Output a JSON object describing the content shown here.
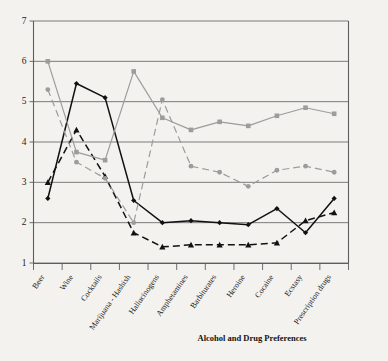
{
  "chart_data": {
    "type": "line",
    "title": "",
    "xlabel": "Alcohol and Drug Preferences",
    "ylabel": "",
    "ylim": [
      1,
      7
    ],
    "yticks": [
      1,
      2,
      3,
      4,
      5,
      6,
      7
    ],
    "grid": true,
    "legend": "none",
    "categories": [
      "Beer",
      "Wine",
      "Cocktails",
      "Marijuana - Hashish",
      "Hallucinogens",
      "Amphetamines",
      "Barbiturates",
      "Heroine",
      "Cocaine",
      "Ecstasy",
      "Prescription drugs"
    ],
    "series": [
      {
        "name": "series-black-solid",
        "color": "#111111",
        "line_style": "solid",
        "marker": "diamond",
        "values": [
          2.6,
          5.45,
          5.1,
          2.55,
          2.0,
          2.05,
          2.0,
          1.95,
          2.35,
          1.75,
          2.6
        ]
      },
      {
        "name": "series-black-dashed",
        "color": "#111111",
        "line_style": "dashed",
        "marker": "triangle",
        "values": [
          3.0,
          4.3,
          3.15,
          1.75,
          1.4,
          1.45,
          1.45,
          1.45,
          1.5,
          2.05,
          2.25
        ]
      },
      {
        "name": "series-gray-solid",
        "color": "#9c9c9c",
        "line_style": "solid",
        "marker": "square",
        "values": [
          6.0,
          3.75,
          3.55,
          5.75,
          4.6,
          4.3,
          4.5,
          4.4,
          4.65,
          4.85,
          4.7
        ]
      },
      {
        "name": "series-gray-dashed",
        "color": "#9c9c9c",
        "line_style": "dashed",
        "marker": "circle",
        "values": [
          5.3,
          3.5,
          3.1,
          2.0,
          5.05,
          3.4,
          3.25,
          2.9,
          3.3,
          3.4,
          3.25
        ]
      }
    ]
  },
  "axis": {
    "y_tick_labels": [
      "1",
      "2",
      "3",
      "4",
      "5",
      "6",
      "7"
    ],
    "x_axis_title": "Alcohol and Drug Preferences"
  }
}
